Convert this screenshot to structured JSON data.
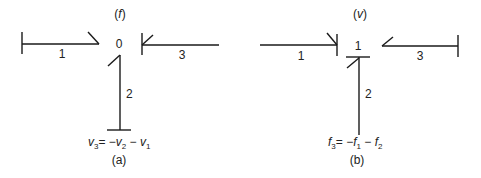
{
  "diagram_a": {
    "header": "(f)",
    "junction": "0",
    "bonds": [
      {
        "id": "bond-1",
        "label": "1"
      },
      {
        "id": "bond-2",
        "label": "2"
      },
      {
        "id": "bond-3",
        "label": "3"
      }
    ],
    "equation": {
      "lhs_var": "v",
      "lhs_sub": "3",
      "op1": "= −",
      "t1_var": "v",
      "t1_sub": "2",
      "op2": " − ",
      "t2_var": "v",
      "t2_sub": "1"
    },
    "caption": "(a)"
  },
  "diagram_b": {
    "header": "(v)",
    "junction": "1",
    "bonds": [
      {
        "id": "bond-1",
        "label": "1"
      },
      {
        "id": "bond-2",
        "label": "2"
      },
      {
        "id": "bond-3",
        "label": "3"
      }
    ],
    "equation": {
      "lhs_var": "f",
      "lhs_sub": "3",
      "op1": "= −",
      "t1_var": "f",
      "t1_sub": "1",
      "op2": " − ",
      "t2_var": "f",
      "t2_sub": "2"
    },
    "caption": "(b)"
  }
}
